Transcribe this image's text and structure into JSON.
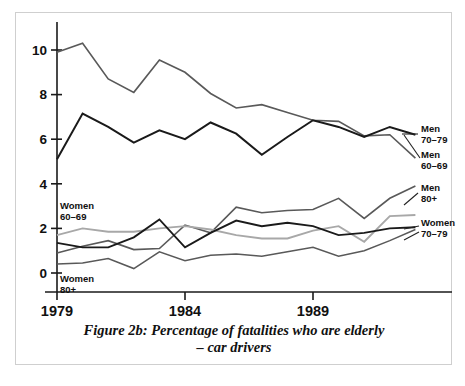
{
  "figure": {
    "caption_line1": "Figure 2b: Percentage of fatalities who are elderly",
    "caption_line2": "– car drivers"
  },
  "axes": {
    "y_ticks": [
      "0",
      "2",
      "4",
      "6",
      "8",
      "10"
    ],
    "x_ticks": [
      "1979",
      "1984",
      "1989"
    ]
  },
  "annotations": {
    "men_70_79_l1": "Men",
    "men_70_79_l2": "70–79",
    "men_60_69_l1": "Men",
    "men_60_69_l2": "60–69",
    "men_80_l1": "Men",
    "men_80_l2": "80+",
    "women_70_79_l1": "Women",
    "women_70_79_l2": "70–79",
    "women_60_69_l1": "Women",
    "women_60_69_l2": "60–69",
    "women_80_l1": "Women",
    "women_80_l2": "80+"
  },
  "colors": {
    "dark_line": "#1a1a1a",
    "mid_line": "#595959",
    "light_line": "#a8a8a8",
    "axis": "#1a1a1a",
    "frame": "#cfcfcf",
    "background": "#ffffff"
  },
  "chart_data": {
    "type": "line",
    "title": "Figure 2b: Percentage of fatalities who are elderly – car drivers",
    "xlabel": "",
    "ylabel": "",
    "xlim": [
      1979,
      1993
    ],
    "ylim": [
      0,
      11.2
    ],
    "grid": false,
    "legend": "inline-annotations",
    "x": [
      1979,
      1980,
      1981,
      1982,
      1983,
      1984,
      1985,
      1986,
      1987,
      1988,
      1989,
      1990,
      1991,
      1992,
      1993
    ],
    "series": [
      {
        "name": "Men 60–69",
        "color": "#595959",
        "width": 1.6,
        "values": [
          9.9,
          10.3,
          8.7,
          8.1,
          9.55,
          9.0,
          8.05,
          7.4,
          7.55,
          7.2,
          6.85,
          6.8,
          6.15,
          6.2,
          5.15
        ]
      },
      {
        "name": "Men 70–79",
        "color": "#1a1a1a",
        "width": 2.0,
        "values": [
          5.1,
          7.15,
          6.55,
          5.85,
          6.4,
          6.0,
          6.75,
          6.25,
          5.3,
          6.1,
          6.85,
          6.55,
          6.1,
          6.55,
          6.2
        ]
      },
      {
        "name": "Men 80+",
        "color": "#595959",
        "width": 1.6,
        "values": [
          0.9,
          1.2,
          1.45,
          1.05,
          1.1,
          2.15,
          1.8,
          2.95,
          2.7,
          2.8,
          2.85,
          3.35,
          2.45,
          3.35,
          3.9
        ]
      },
      {
        "name": "Women 60–69",
        "color": "#a8a8a8",
        "width": 1.9,
        "values": [
          1.7,
          2.0,
          1.85,
          1.85,
          2.0,
          2.1,
          1.95,
          1.7,
          1.55,
          1.55,
          1.9,
          2.1,
          1.4,
          2.55,
          2.6
        ]
      },
      {
        "name": "Women 70–79",
        "color": "#1a1a1a",
        "width": 1.9,
        "values": [
          1.35,
          1.15,
          1.15,
          1.6,
          2.4,
          1.15,
          1.8,
          2.35,
          2.1,
          2.25,
          2.1,
          1.7,
          1.8,
          2.0,
          2.05
        ]
      },
      {
        "name": "Women 80+",
        "color": "#595959",
        "width": 1.5,
        "values": [
          0.4,
          0.45,
          0.65,
          0.2,
          0.95,
          0.55,
          0.8,
          0.85,
          0.75,
          0.95,
          1.15,
          0.75,
          1.0,
          1.45,
          1.95
        ]
      }
    ]
  }
}
